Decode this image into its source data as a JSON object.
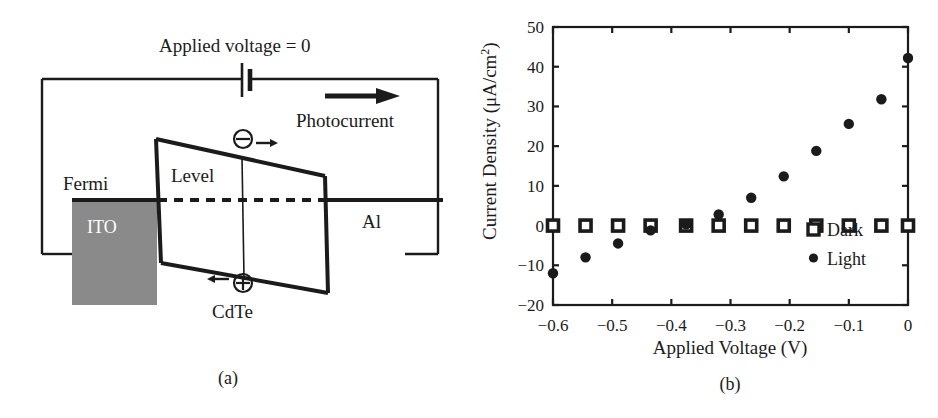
{
  "figure": {
    "panels": [
      {
        "id": "a",
        "caption": "(a)",
        "type": "band-diagram",
        "labels": {
          "applied_voltage": "Applied voltage = 0",
          "photocurrent": "Photocurrent",
          "fermi": "Fermi",
          "level": "Level",
          "ito": "ITO",
          "cdte": "CdTe",
          "al": "Al",
          "electron": "⊖",
          "hole": "⊕",
          "electron_arrow": "→",
          "hole_arrow": "←"
        },
        "colors": {
          "line": "#1b1b1b",
          "ito_fill": "#8a8a8a",
          "ito_text": "#ffffff"
        }
      },
      {
        "id": "b",
        "caption": "(b)",
        "type": "chart"
      }
    ]
  },
  "chart_data": {
    "type": "scatter",
    "title": "",
    "xlabel": "Applied Voltage (V)",
    "ylabel": "Current Density (μA/cm²)",
    "ylabel_base": "Current Density (μA/cm",
    "ylabel_sup": "2",
    "ylabel_close": ")",
    "xlim": [
      -0.6,
      0
    ],
    "ylim": [
      -20,
      50
    ],
    "xticks": [
      -0.6,
      -0.5,
      -0.4,
      -0.3,
      -0.2,
      -0.1,
      0
    ],
    "xticklabels": [
      "−0.6",
      "−0.5",
      "−0.4",
      "−0.3",
      "−0.2",
      "−0.1",
      "0"
    ],
    "yticks": [
      -20,
      -10,
      0,
      10,
      20,
      30,
      40,
      50
    ],
    "yticklabels": [
      "−20",
      "−10",
      "0",
      "10",
      "20",
      "30",
      "40",
      "50"
    ],
    "grid": false,
    "legend_position": "lower-right",
    "series": [
      {
        "name": "Dark",
        "marker": "open-square",
        "color": "#1b1b1b",
        "x": [
          -0.6,
          -0.545,
          -0.49,
          -0.435,
          -0.375,
          -0.32,
          -0.265,
          -0.21,
          -0.155,
          -0.1,
          -0.045,
          0.0
        ],
        "y": [
          0,
          0,
          0,
          0,
          0,
          0,
          0,
          0,
          0,
          0,
          0,
          0
        ]
      },
      {
        "name": "Light",
        "marker": "filled-circle",
        "color": "#1b1b1b",
        "x": [
          -0.6,
          -0.545,
          -0.49,
          -0.435,
          -0.375,
          -0.32,
          -0.265,
          -0.21,
          -0.155,
          -0.1,
          -0.045,
          0.0
        ],
        "y": [
          -12.0,
          -8.0,
          -4.5,
          -1.2,
          0.3,
          2.8,
          7.0,
          12.4,
          18.8,
          25.6,
          31.8,
          42.2
        ]
      }
    ]
  }
}
